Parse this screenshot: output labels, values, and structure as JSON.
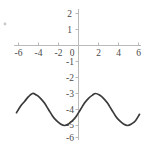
{
  "chart_data": {
    "type": "line",
    "title": "",
    "subtitle": "",
    "xlabel": "",
    "ylabel": "",
    "xlim": [
      -6.9,
      6.5
    ],
    "ylim": [
      -6.4,
      2.4
    ],
    "xticks": [
      -6,
      -4,
      -2,
      0,
      2,
      4,
      6
    ],
    "xtick_labels": [
      "-6",
      "-4",
      "-2",
      "0",
      "2",
      "4",
      "6"
    ],
    "yticks": [
      2,
      1,
      0,
      -1,
      -2,
      -3,
      -4,
      -5,
      -6
    ],
    "ytick_labels": [
      "2",
      "1",
      "0",
      "-1",
      "-2",
      "-3",
      "-4",
      "-5",
      "-6"
    ],
    "grid": false,
    "legend": false,
    "axis_color": "#b9b9b9",
    "curve_color": "#3a3a3a",
    "background_color": "#ffffff",
    "series": [
      {
        "name": "sinusoid",
        "description": "y = -4 + cos(x + 1.4), midline -4, amplitude 1, period 2*pi",
        "midline": -4,
        "amplitude": 1,
        "period": 6.28,
        "maxima_x": [
          -4.6,
          1.7
        ],
        "minima_x": [
          -1.4,
          4.9
        ],
        "max_value": -3,
        "min_value": -5,
        "x": [
          -6.2,
          -5.8,
          -5.4,
          -5.0,
          -4.6,
          -4.2,
          -3.8,
          -3.4,
          -3.0,
          -2.6,
          -2.2,
          -1.8,
          -1.4,
          -1.0,
          -0.6,
          -0.2,
          0.2,
          0.6,
          1.0,
          1.4,
          1.7,
          2.1,
          2.5,
          2.9,
          3.3,
          3.7,
          4.1,
          4.5,
          4.9,
          5.3,
          5.7,
          6.1
        ],
        "y": [
          -4.2,
          -3.8,
          -3.5,
          -3.2,
          -3.0,
          -3.1,
          -3.3,
          -3.6,
          -4.0,
          -4.4,
          -4.7,
          -4.9,
          -5.0,
          -4.9,
          -4.7,
          -4.4,
          -4.0,
          -3.6,
          -3.3,
          -3.1,
          -3.0,
          -3.1,
          -3.3,
          -3.6,
          -4.0,
          -4.4,
          -4.7,
          -4.9,
          -5.0,
          -4.9,
          -4.7,
          -4.3
        ]
      }
    ]
  }
}
